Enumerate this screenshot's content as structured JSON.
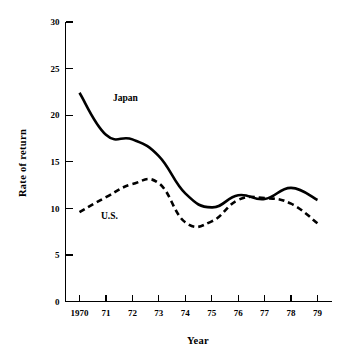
{
  "chart_data": {
    "type": "line",
    "title": "",
    "xlabel": "Year",
    "ylabel": "Rate of return",
    "x": [
      "1970",
      "71",
      "72",
      "73",
      "74",
      "75",
      "76",
      "77",
      "78",
      "79"
    ],
    "xtick_labels": [
      "1970",
      "71",
      "72",
      "73",
      "74",
      "75",
      "76",
      "77",
      "78",
      "79"
    ],
    "ytick_labels": [
      "0",
      "5",
      "10",
      "15",
      "20",
      "25",
      "30"
    ],
    "yticks": [
      0,
      5,
      10,
      15,
      20,
      25,
      30
    ],
    "ylim": [
      0,
      30
    ],
    "grid": false,
    "legend_position": "inline-annotations",
    "series": [
      {
        "name": "Japan",
        "style": "solid",
        "color": "#000000",
        "values": [
          22.4,
          17.9,
          17.4,
          15.6,
          11.6,
          10.1,
          11.4,
          11.0,
          12.2,
          10.9
        ]
      },
      {
        "name": "U.S.",
        "style": "dashed",
        "color": "#000000",
        "values": [
          9.6,
          11.2,
          12.6,
          12.7,
          8.5,
          8.6,
          10.9,
          11.1,
          10.5,
          8.4
        ]
      }
    ],
    "annotations": [
      {
        "text": "Japan",
        "series": "Japan",
        "x_px": 113,
        "y_px": 101
      },
      {
        "text": "U.S.",
        "series": "U.S.",
        "x_px": 101,
        "y_px": 219
      }
    ]
  },
  "axis": {
    "y_title": "Rate of return",
    "x_title": "Year"
  }
}
